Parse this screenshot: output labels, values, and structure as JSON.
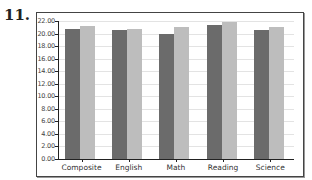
{
  "question_number": "11.",
  "chart_data": {
    "type": "bar",
    "title": "",
    "xlabel": "",
    "ylabel": "",
    "categories": [
      "Composite",
      "English",
      "Math",
      "Reading",
      "Science"
    ],
    "series": [
      {
        "name": "Series 1 (dark)",
        "color": "#6b6b6b",
        "values": [
          20.8,
          20.5,
          20.0,
          21.3,
          20.6
        ]
      },
      {
        "name": "Series 2 (light)",
        "color": "#bdbdbd",
        "values": [
          21.2,
          20.8,
          21.0,
          21.8,
          21.1
        ]
      }
    ],
    "ylim": [
      0,
      22
    ],
    "yticks": [
      "0.00",
      "2.00",
      "4.00",
      "6.00",
      "8.00",
      "10.00",
      "12.00",
      "14.00",
      "16.00",
      "18.00",
      "20.00",
      "22.00"
    ],
    "grid": true,
    "legend": "none"
  }
}
